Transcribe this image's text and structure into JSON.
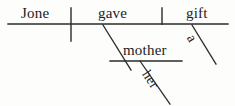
{
  "diagram": {
    "type": "reed-kellogg-sentence-diagram",
    "background_color": "#fdfdfb",
    "ink_color": "#2a2a2a",
    "text_color": "#1c1c1c",
    "words": {
      "subject": "Jone",
      "verb": "gave",
      "direct_object": "gift",
      "indirect_object": "mother",
      "article_modifier": "a",
      "possessive_modifier": "her"
    },
    "lines": {
      "baseline": {
        "x1": 8,
        "y1": 24,
        "x2": 228,
        "y2": 24
      },
      "subject_verb_divider": {
        "x1": 71,
        "y1": 8,
        "x2": 71,
        "y2": 41
      },
      "verb_object_divider": {
        "x1": 162,
        "y1": 8,
        "x2": 162,
        "y2": 24
      },
      "indirect_object_slant": {
        "x1": 103,
        "y1": 25,
        "x2": 131,
        "y2": 70
      },
      "indirect_object_baseline": {
        "x1": 110,
        "y1": 61,
        "x2": 182,
        "y2": 61
      },
      "article_slant": {
        "x1": 192,
        "y1": 25,
        "x2": 216,
        "y2": 64
      },
      "possessive_slant": {
        "x1": 140,
        "y1": 61,
        "x2": 170,
        "y2": 104
      }
    }
  }
}
